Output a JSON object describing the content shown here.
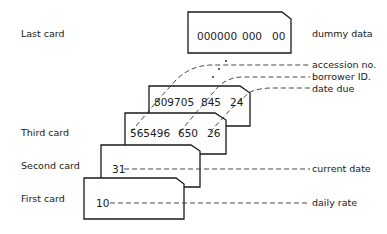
{
  "left_labels": {
    "last_card": "Last card",
    "third_card": "Third card",
    "second_card": "Second card",
    "first_card": "First card"
  },
  "cards": {
    "last": {
      "field1": "000000",
      "field2": "000",
      "field3": "00"
    },
    "fourth": {
      "field1": "809705",
      "field2": "845",
      "field3": "24"
    },
    "third": {
      "field1": "565496",
      "field2": "650",
      "field3": "26"
    },
    "second": {
      "field1": "31"
    },
    "first": {
      "field1": "10"
    }
  },
  "right_labels": {
    "dummy_data": "dummy data",
    "accession_no": "accession no.",
    "borrower_id": "borrower ID.",
    "date_due": "date due",
    "current_date": "current date",
    "daily_rate": "daily rate"
  }
}
